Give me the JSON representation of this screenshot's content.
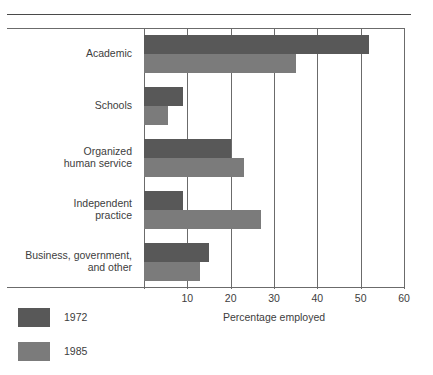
{
  "chart_data": {
    "type": "bar",
    "orientation": "horizontal",
    "title": "",
    "xlabel": "Percentage employed",
    "ylabel": "",
    "xlim": [
      0,
      60
    ],
    "xticks": [
      10,
      20,
      30,
      40,
      50,
      60
    ],
    "xtick_labels": [
      "10",
      "20",
      "30",
      "40",
      "50",
      "60"
    ],
    "grid": "vertical",
    "legend_position": "bottom-left",
    "categories": [
      "Academic",
      "Schools",
      "Organized\nhuman service",
      "Independent\npractice",
      "Business, government,\nand other"
    ],
    "series": [
      {
        "name": "1972",
        "color": "#585858",
        "values": [
          52,
          9,
          20,
          9,
          15
        ]
      },
      {
        "name": "1985",
        "color": "#7b7b7b",
        "values": [
          35,
          5.5,
          23,
          27,
          13
        ]
      }
    ]
  },
  "axis": {
    "tick_labels": [
      "10",
      "20",
      "30",
      "40",
      "50",
      "60"
    ],
    "title": "Percentage employed"
  },
  "legend": {
    "items": [
      {
        "label": "1972",
        "color": "#585858"
      },
      {
        "label": "1985",
        "color": "#7b7b7b"
      }
    ]
  },
  "categories": {
    "items": [
      {
        "label": "Academic"
      },
      {
        "label": "Schools"
      },
      {
        "label": "Organized\nhuman service"
      },
      {
        "label": "Independent\npractice"
      },
      {
        "label": "Business, government,\nand other"
      }
    ]
  }
}
